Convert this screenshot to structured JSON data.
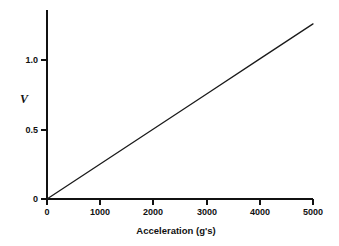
{
  "chart_data": {
    "type": "line",
    "title": "",
    "subtitle": "",
    "xlabel": "Acceleration (g's)",
    "ylabel": "V",
    "xlim": [
      0,
      5300
    ],
    "ylim": [
      0,
      1.37
    ],
    "xticks": [
      0,
      1000,
      2000,
      3000,
      4000,
      5000
    ],
    "xticklabels": [
      "0",
      "1000",
      "2000",
      "3000",
      "4000",
      "5000"
    ],
    "yticks": [
      0,
      0.5,
      1.0
    ],
    "yticklabels": [
      "0",
      "0.5",
      "1.0"
    ],
    "grid": false,
    "legend": false,
    "legend_position": "none",
    "series": [
      {
        "name": "V vs Acceleration",
        "color": "#1a1a1a",
        "linewidth": 1,
        "x": [
          0,
          1000,
          2000,
          3000,
          4000,
          5000
        ],
        "y": [
          0,
          0.252,
          0.504,
          0.756,
          1.008,
          1.26
        ]
      }
    ],
    "annotations": []
  },
  "axes": {
    "x_title": "Acceleration (g's)",
    "y_title": "V",
    "x_tick_labels": [
      "0",
      "1000",
      "2000",
      "3000",
      "4000",
      "5000"
    ],
    "y_tick_labels": [
      "0",
      "0.5",
      "1.0"
    ]
  },
  "style": {
    "background": "#ffffff",
    "axis_color": "#111111",
    "line_color": "#1a1a1a"
  }
}
